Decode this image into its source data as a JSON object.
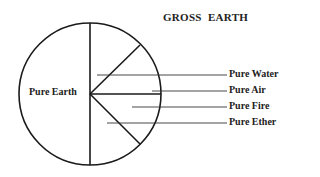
{
  "title": "GROSS  EARTH",
  "center_label": "Pure Earth",
  "labels": [
    {
      "text": "Pure Water",
      "y": 75
    },
    {
      "text": "Pure Air",
      "y": 91
    },
    {
      "text": "Pure Fire",
      "y": 107
    },
    {
      "text": "Pure Ether",
      "y": 123
    }
  ],
  "colors": {
    "stroke": "#1a1a1a",
    "leader": "#333333",
    "text": "#222222"
  }
}
